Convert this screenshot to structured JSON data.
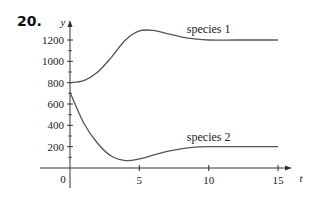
{
  "problem_number": "20.",
  "chart_data": {
    "type": "line",
    "title": "",
    "xlabel": "t",
    "ylabel": "y",
    "xlim": [
      0,
      15
    ],
    "ylim": [
      0,
      1300
    ],
    "grid": false,
    "x_ticks": [
      5,
      10,
      15
    ],
    "x_tick_labels": [
      "5",
      "10",
      "15"
    ],
    "y_ticks": [
      200,
      400,
      600,
      800,
      1000,
      1200
    ],
    "y_tick_labels": [
      "200",
      "400",
      "600",
      "800",
      "1000",
      "1200"
    ],
    "y_minor_ticks": [
      100,
      300,
      500,
      700,
      900,
      1100
    ],
    "origin_label": "0",
    "series": [
      {
        "name": "species 1",
        "x": [
          0,
          1,
          2,
          3,
          4,
          5,
          6,
          7,
          8,
          9,
          10,
          12,
          15
        ],
        "y": [
          800,
          820,
          900,
          1040,
          1200,
          1285,
          1290,
          1260,
          1230,
          1210,
          1200,
          1200,
          1200
        ]
      },
      {
        "name": "species 2",
        "x": [
          0,
          1,
          2,
          3,
          4,
          5,
          6,
          7,
          8,
          9,
          10,
          12,
          15
        ],
        "y": [
          710,
          420,
          230,
          110,
          70,
          85,
          120,
          155,
          180,
          195,
          200,
          200,
          200
        ]
      }
    ],
    "annotations": [
      {
        "text": "species 1",
        "near_series": "species 1",
        "x": 10,
        "y": 1270
      },
      {
        "text": "species 2",
        "near_series": "species 2",
        "x": 10,
        "y": 255
      }
    ]
  }
}
